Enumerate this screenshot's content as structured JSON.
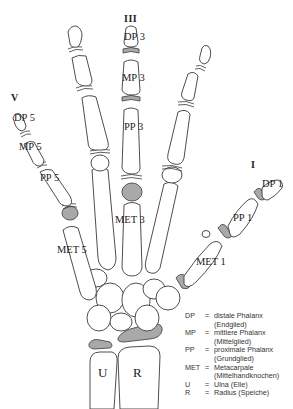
{
  "finger_numerals": {
    "thumb": "I",
    "middle": "III",
    "little": "V"
  },
  "labels": {
    "dp3": "DP 3",
    "mp3": "MP 3",
    "pp3": "PP 3",
    "met3": "MET 3",
    "dp5": "DP 5",
    "mp5": "MP 5",
    "pp5": "PP 5",
    "met5": "MET 5",
    "dp1": "DP 1",
    "pp1": "PP 1",
    "met1": "MET 1",
    "ulna": "U",
    "radius": "R"
  },
  "legend": [
    {
      "abbr": "DP",
      "eq": "=",
      "lines": [
        "distale Phalanx",
        "(Endglied)"
      ]
    },
    {
      "abbr": "MP",
      "eq": "=",
      "lines": [
        "mittlere Phalanx",
        "(Mittelglied)"
      ]
    },
    {
      "abbr": "PP",
      "eq": "=",
      "lines": [
        "proximale Phalanx",
        "(Grundglied)"
      ]
    },
    {
      "abbr": "MET",
      "eq": "=",
      "lines": [
        "Metacarpale",
        "(Mittelhandknochen)"
      ]
    },
    {
      "abbr": "U",
      "eq": "=",
      "lines": [
        "Ulna (Elle)"
      ]
    },
    {
      "abbr": "R",
      "eq": "=",
      "lines": [
        "Radius (Speiche)"
      ]
    }
  ],
  "colors": {
    "highlight_plate": "#a9a9a9",
    "outline": "#3a3a3a"
  }
}
